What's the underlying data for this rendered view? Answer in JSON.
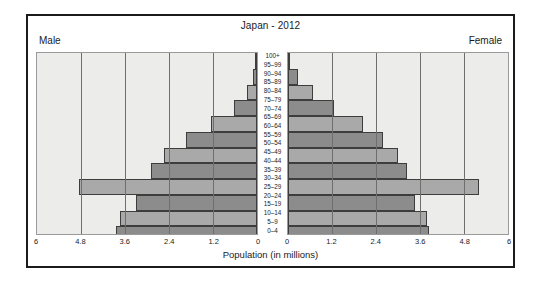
{
  "figure": {
    "title": "Japan - 2012",
    "left_label": "Male",
    "right_label": "Female",
    "xaxis_title": "Population (in millions)"
  },
  "chart_data": {
    "type": "bar",
    "subtype": "population-pyramid",
    "title": "Japan - 2012",
    "xlabel": "Population (in millions)",
    "ylabel": "",
    "xlim": [
      0,
      6
    ],
    "xticks": [
      "6",
      "4.8",
      "3.6",
      "2.4",
      "1.2",
      "0"
    ],
    "xticks_values": [
      6,
      4.8,
      3.6,
      2.4,
      1.2,
      0
    ],
    "grid": true,
    "legend_position": "corner-labels",
    "categories": [
      "100+",
      "95–99",
      "90–94",
      "85–89",
      "80–84",
      "75–79",
      "70–74",
      "65–69",
      "60–64",
      "55–59",
      "50–54",
      "45–49",
      "40–44",
      "35–39",
      "30–34",
      "25–29",
      "20–24",
      "15–19",
      "10–14",
      "5–9",
      "0–4"
    ],
    "series": [
      {
        "name": "Male",
        "direction": "left",
        "color": "#8c8c8c",
        "alt_color": "#a9a9a9",
        "values": [
          0.02,
          0.1,
          0.28,
          0.62,
          1.25,
          1.95,
          2.55,
          2.9,
          4.85,
          3.3,
          3.75,
          3.85,
          4.5,
          4.95,
          3.85,
          3.35,
          3.05,
          3.0,
          2.85,
          2.7,
          2.45
        ]
      },
      {
        "name": "Female",
        "direction": "right",
        "color": "#8c8c8c",
        "alt_color": "#a9a9a9",
        "values": [
          0.06,
          0.28,
          0.68,
          1.25,
          2.05,
          2.6,
          3.0,
          3.25,
          5.2,
          3.45,
          3.8,
          3.85,
          4.45,
          4.7,
          3.7,
          3.2,
          2.9,
          2.85,
          2.7,
          2.6,
          2.35
        ]
      }
    ]
  }
}
